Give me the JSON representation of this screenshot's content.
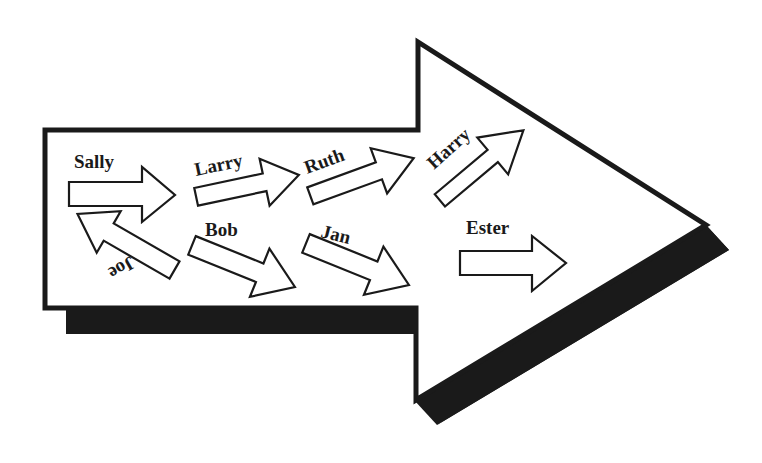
{
  "diagram": {
    "type": "process-flow-arrow",
    "colors": {
      "outline": "#1a1a1a",
      "fill": "#ffffff",
      "shadow": "#1a1a1a",
      "background": "#ffffff"
    },
    "people": [
      {
        "id": "sally",
        "label": "Sally",
        "direction": "right"
      },
      {
        "id": "joe",
        "label": "Joe",
        "direction": "up-left",
        "text_orientation": "upside-down"
      },
      {
        "id": "larry",
        "label": "Larry",
        "direction": "right-up"
      },
      {
        "id": "bob",
        "label": "Bob",
        "direction": "right-down"
      },
      {
        "id": "ruth",
        "label": "Ruth",
        "direction": "right-up"
      },
      {
        "id": "jan",
        "label": "Jan",
        "direction": "right-down"
      },
      {
        "id": "harry",
        "label": "Harry",
        "direction": "up-right"
      },
      {
        "id": "ester",
        "label": "Ester",
        "direction": "right"
      }
    ]
  }
}
